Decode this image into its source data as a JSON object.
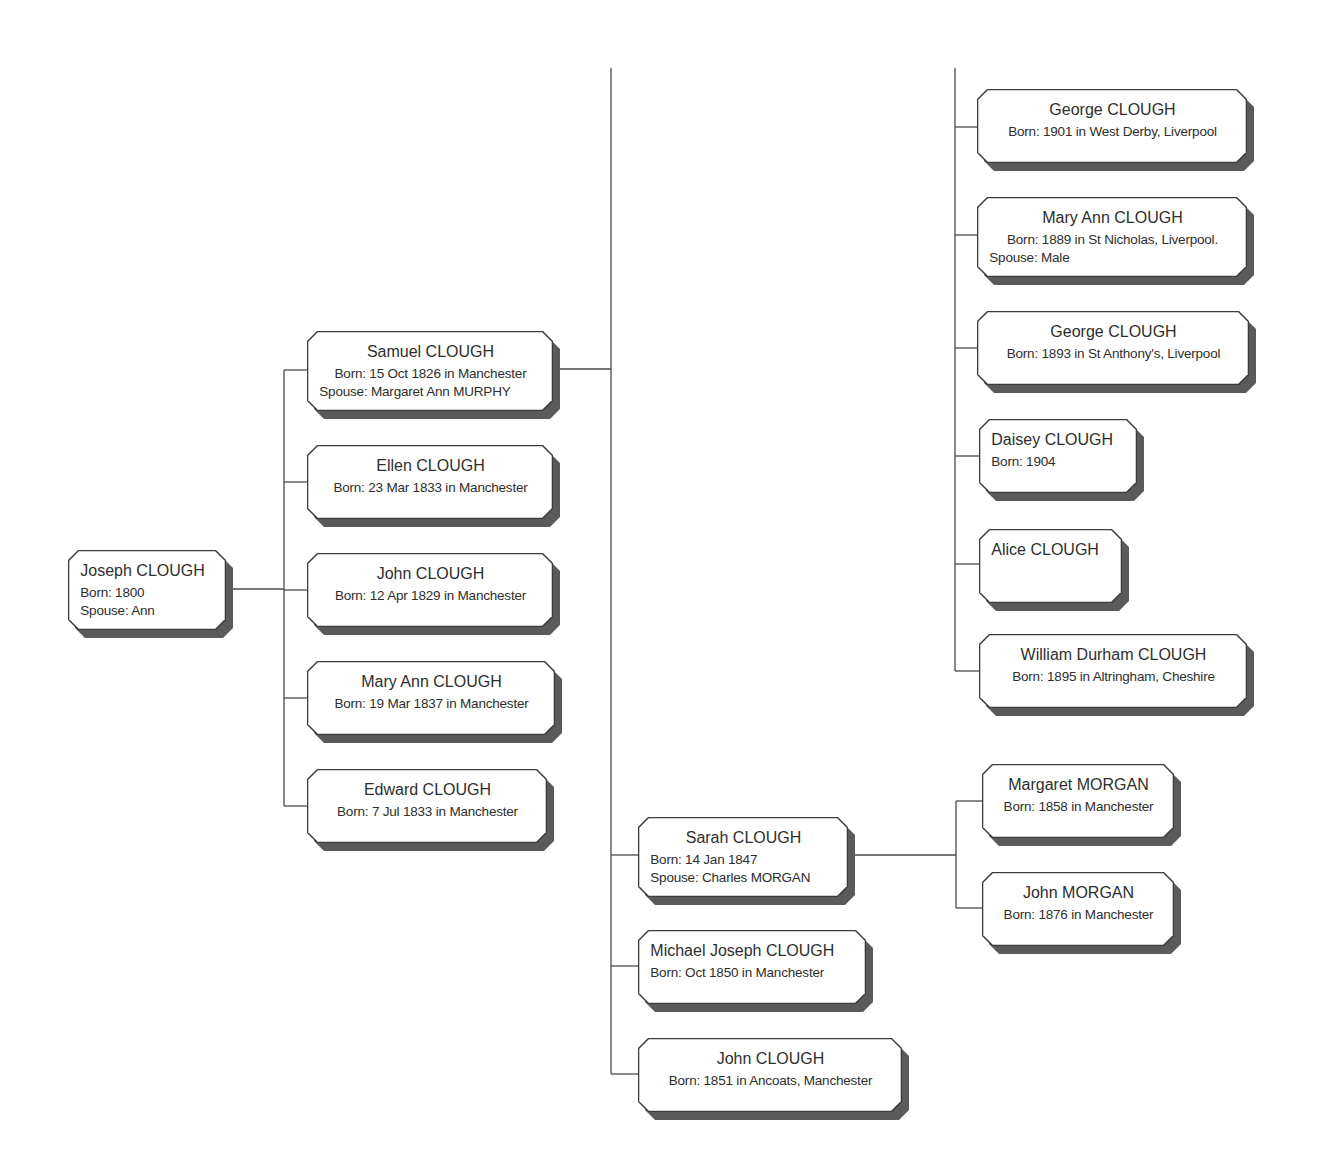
{
  "diagram": {
    "type": "family-tree-descendants",
    "line_color": "#4a4a4a",
    "box_border_color": "#3c3c3c",
    "box_shadow_color": "#5a5a5a",
    "box_fill_color": "#ffffff"
  },
  "people": [
    {
      "id": "joseph",
      "name": "Joseph CLOUGH",
      "born": "Born: 1800",
      "spouse": "Spouse: Ann",
      "align": "left",
      "x": 68,
      "y": 550,
      "w": 158,
      "h": 80
    },
    {
      "id": "samuel",
      "name": "Samuel CLOUGH",
      "born": "Born: 15 Oct 1826 in Manchester",
      "spouse": "Spouse: Margaret Ann MURPHY",
      "align": "center",
      "x": 307,
      "y": 331,
      "w": 246,
      "h": 80
    },
    {
      "id": "ellen",
      "name": "Ellen CLOUGH",
      "born": "Born: 23 Mar 1833 in Manchester",
      "spouse": "",
      "align": "center",
      "x": 307,
      "y": 445,
      "w": 246,
      "h": 74
    },
    {
      "id": "john1829",
      "name": "John CLOUGH",
      "born": "Born: 12 Apr 1829 in Manchester",
      "spouse": "",
      "align": "center",
      "x": 307,
      "y": 553,
      "w": 246,
      "h": 74
    },
    {
      "id": "maryann1837",
      "name": "Mary Ann CLOUGH",
      "born": "Born: 19 Mar 1837 in Manchester",
      "spouse": "",
      "align": "center",
      "x": 307,
      "y": 661,
      "w": 248,
      "h": 74
    },
    {
      "id": "edward",
      "name": "Edward CLOUGH",
      "born": "Born: 7 Jul 1833 in Manchester",
      "spouse": "",
      "align": "center",
      "x": 307,
      "y": 769,
      "w": 240,
      "h": 74
    },
    {
      "id": "george1901",
      "name": "George CLOUGH",
      "born": "Born: 1901 in West Derby, Liverpool",
      "spouse": "",
      "align": "center",
      "x": 977,
      "y": 89,
      "w": 270,
      "h": 74
    },
    {
      "id": "maryann1889",
      "name": "Mary Ann CLOUGH",
      "born": "Born: 1889 in St Nicholas, Liverpool.",
      "spouse": "Spouse: Male",
      "align": "center",
      "x": 977,
      "y": 197,
      "w": 270,
      "h": 80
    },
    {
      "id": "george1893",
      "name": "George CLOUGH",
      "born": "Born: 1893 in St Anthony's, Liverpool",
      "spouse": "",
      "align": "center",
      "x": 977,
      "y": 311,
      "w": 272,
      "h": 74
    },
    {
      "id": "daisey",
      "name": "Daisey CLOUGH",
      "born": "Born: 1904",
      "spouse": "",
      "align": "left",
      "x": 979,
      "y": 419,
      "w": 158,
      "h": 74
    },
    {
      "id": "alice",
      "name": "Alice CLOUGH",
      "born": "",
      "spouse": "",
      "align": "left",
      "x": 979,
      "y": 529,
      "w": 143,
      "h": 74
    },
    {
      "id": "william",
      "name": "William Durham CLOUGH",
      "born": "Born: 1895 in Altringham, Cheshire",
      "spouse": "",
      "align": "center",
      "x": 979,
      "y": 634,
      "w": 268,
      "h": 74
    },
    {
      "id": "sarah",
      "name": "Sarah CLOUGH",
      "born": "Born: 14 Jan 1847",
      "spouse": "Spouse: Charles MORGAN",
      "align": "center-name",
      "x": 638,
      "y": 817,
      "w": 210,
      "h": 80
    },
    {
      "id": "michael",
      "name": "Michael Joseph CLOUGH",
      "born": "Born: Oct 1850 in Manchester",
      "spouse": "",
      "align": "left",
      "x": 638,
      "y": 930,
      "w": 228,
      "h": 74
    },
    {
      "id": "john1851",
      "name": "John CLOUGH",
      "born": "Born: 1851 in Ancoats, Manchester",
      "spouse": "",
      "align": "center",
      "x": 638,
      "y": 1038,
      "w": 264,
      "h": 74
    },
    {
      "id": "margaretmorgan",
      "name": "Margaret MORGAN",
      "born": "Born: 1858 in Manchester",
      "spouse": "",
      "align": "center",
      "x": 982,
      "y": 764,
      "w": 192,
      "h": 74
    },
    {
      "id": "johnmorgan",
      "name": "John MORGAN",
      "born": "Born: 1876 in Manchester",
      "spouse": "",
      "align": "center",
      "x": 982,
      "y": 872,
      "w": 192,
      "h": 74
    }
  ],
  "connectors": [
    {
      "x1": 226,
      "y1": 589,
      "x2": 284,
      "y2": 589
    },
    {
      "x1": 284,
      "y1": 370,
      "x2": 284,
      "y2": 806
    },
    {
      "x1": 284,
      "y1": 370,
      "x2": 307,
      "y2": 370
    },
    {
      "x1": 284,
      "y1": 482,
      "x2": 307,
      "y2": 482
    },
    {
      "x1": 284,
      "y1": 590,
      "x2": 307,
      "y2": 590
    },
    {
      "x1": 284,
      "y1": 698,
      "x2": 307,
      "y2": 698
    },
    {
      "x1": 284,
      "y1": 806,
      "x2": 307,
      "y2": 806
    },
    {
      "x1": 553,
      "y1": 369,
      "x2": 611,
      "y2": 369
    },
    {
      "x1": 611,
      "y1": 68,
      "x2": 611,
      "y2": 1074
    },
    {
      "x1": 611,
      "y1": 855,
      "x2": 638,
      "y2": 855
    },
    {
      "x1": 611,
      "y1": 966,
      "x2": 638,
      "y2": 966
    },
    {
      "x1": 611,
      "y1": 1074,
      "x2": 638,
      "y2": 1074
    },
    {
      "x1": 955,
      "y1": 68,
      "x2": 955,
      "y2": 671
    },
    {
      "x1": 955,
      "y1": 127,
      "x2": 977,
      "y2": 127
    },
    {
      "x1": 955,
      "y1": 235,
      "x2": 977,
      "y2": 235
    },
    {
      "x1": 955,
      "y1": 348,
      "x2": 977,
      "y2": 348
    },
    {
      "x1": 955,
      "y1": 456,
      "x2": 979,
      "y2": 456
    },
    {
      "x1": 955,
      "y1": 564,
      "x2": 979,
      "y2": 564
    },
    {
      "x1": 955,
      "y1": 671,
      "x2": 979,
      "y2": 671
    },
    {
      "x1": 848,
      "y1": 855,
      "x2": 956,
      "y2": 855
    },
    {
      "x1": 956,
      "y1": 801,
      "x2": 956,
      "y2": 908
    },
    {
      "x1": 956,
      "y1": 801,
      "x2": 982,
      "y2": 801
    },
    {
      "x1": 956,
      "y1": 908,
      "x2": 982,
      "y2": 908
    }
  ]
}
